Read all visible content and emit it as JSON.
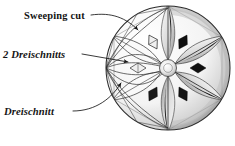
{
  "figure": {
    "kind": "pencil-drawing",
    "background_color": "#ffffff",
    "ink_color": "#141414",
    "canvas": {
      "width": 235,
      "height": 146
    }
  },
  "annotations": [
    {
      "id": "sweeping-cut",
      "label": "Sweeping cut",
      "style": "roman-bold",
      "text_x": 24,
      "text_y": 19,
      "leader": "M 91,15 C 112,12 126,18 138,30",
      "arrow_at": [
        138,
        30
      ]
    },
    {
      "id": "two-dreischnitts",
      "label": "2 Dreischnitts",
      "style": "italic-bold",
      "text_x": 3,
      "text_y": 58,
      "leader": "M 82,54 L 128,62",
      "arrow_at": [
        128,
        62
      ]
    },
    {
      "id": "dreischnitt",
      "label": "Dreischnitt",
      "style": "italic-bold",
      "text_x": 4,
      "text_y": 115,
      "leader": "M 73,111 C 96,111 112,98 121,83",
      "arrow_at": [
        121,
        83
      ]
    }
  ],
  "rosette": {
    "center_x": 168,
    "center_y": 68,
    "radius": 62,
    "hub_radius": 8.5,
    "petal_count": 6,
    "diamond_count": 6,
    "shaded_side": "right",
    "layout_side": "left",
    "rim_color": "#2b2b2b"
  },
  "colors": {
    "paper": "#ffffff",
    "graphite_dark": "#111111",
    "graphite_mid": "#6f6f6f",
    "graphite_light": "#c8c8c8",
    "line": "#2e2e2e"
  }
}
